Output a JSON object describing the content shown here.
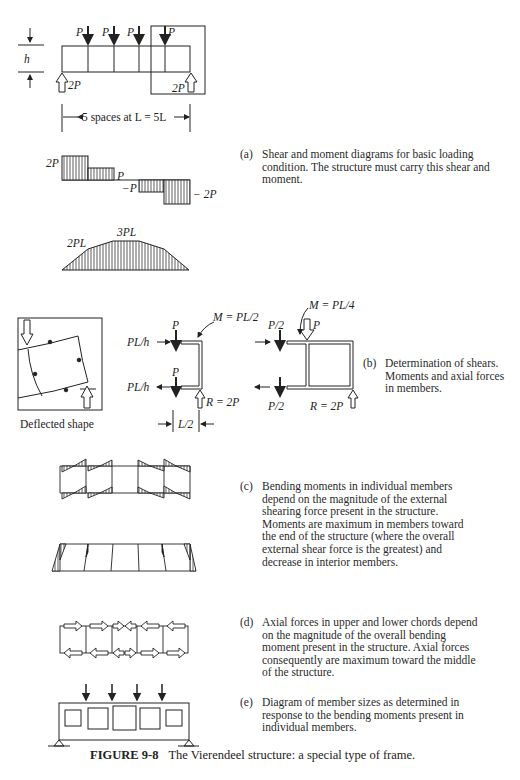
{
  "figure": {
    "number": "FIGURE 9-8",
    "title": "The Vierendeel structure: a special type of frame."
  },
  "part_a": {
    "tag": "(a)",
    "caption": "Shear and moment diagrams for basic loading condition.  The structure must carry this shear and moment.",
    "loads": [
      "P",
      "P",
      "P",
      "P"
    ],
    "reactions": [
      "2P",
      "2P"
    ],
    "height_label": "h",
    "span_label": "5 spaces at L = 5L",
    "shear_labels": [
      "2P",
      "P",
      "−P",
      "− 2P"
    ],
    "moment_labels": [
      "2PL",
      "3PL"
    ]
  },
  "part_b": {
    "tag": "(b)",
    "caption": "Determination of shears. Moments and axial forces in members.",
    "deflected_label": "Deflected shape",
    "left_free_body": {
      "top_axial": "PL/h",
      "bottom_axial": "PL/h",
      "top_shear": "P",
      "bottom_shear": "P",
      "moment": "M = PL/2",
      "reaction": "R = 2P",
      "dimension": "L/2"
    },
    "right_free_body": {
      "top_shear": "P/2",
      "bottom_shear": "P/2",
      "load": "P",
      "moment": "M = PL/4",
      "reaction": "R = 2P"
    }
  },
  "part_c": {
    "tag": "(c)",
    "caption": "Bending moments in individual members depend on the magnitude of the external shearing force present in the structure. Moments are maximum in members toward the end of the structure (where the overall external shear force is the greatest)  and decrease in interior members."
  },
  "part_d": {
    "tag": "(d)",
    "caption": "Axial forces in upper and lower chords depend on the magnitude of the overall bending moment present in the structure. Axial forces consequently are maximum toward the middle of the structure."
  },
  "part_e": {
    "tag": "(e)",
    "caption": "Diagram of member sizes as determined in response to the bending moments present in individual members."
  }
}
